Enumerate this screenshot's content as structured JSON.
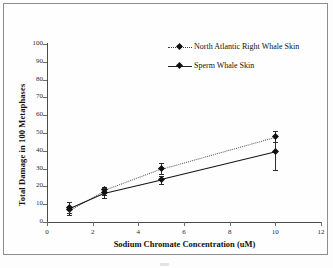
{
  "chart_data": {
    "type": "line",
    "title": "",
    "xlabel": "Sodium Chromate Concentration (uM)",
    "ylabel": "Total Damage in 100 Metaphases",
    "x": [
      1,
      2.5,
      5,
      10
    ],
    "xlim": [
      0,
      12
    ],
    "ylim": [
      0,
      100
    ],
    "xticks": [
      0,
      2,
      4,
      6,
      8,
      10,
      12
    ],
    "yticks": [
      0,
      10,
      20,
      30,
      40,
      50,
      60,
      70,
      80,
      90,
      100
    ],
    "xtick_labels": [
      "0",
      "2",
      "4",
      "6",
      "8",
      "10",
      "12"
    ],
    "ytick_labels": [
      "0",
      "10",
      "20",
      "30",
      "40",
      "50",
      "60",
      "70",
      "80",
      "90",
      "100"
    ],
    "grid": false,
    "legend_position": "upper right inside",
    "series": [
      {
        "name": "North Atlantic Right Whale Skin",
        "style": "dotted",
        "marker": "diamond",
        "color": "#333333",
        "values": [
          7,
          18,
          30,
          48
        ],
        "err_low": [
          4,
          15,
          27,
          45
        ],
        "err_high": [
          11,
          19.5,
          33,
          51
        ]
      },
      {
        "name": "Sperm Whale Skin",
        "style": "solid",
        "marker": "diamond",
        "color": "#141414",
        "values": [
          8,
          16.5,
          24,
          39.5
        ],
        "err_low": [
          5,
          13.5,
          21.5,
          29
        ],
        "err_high": [
          11,
          19,
          26,
          45
        ]
      }
    ]
  },
  "legend": {
    "items": [
      {
        "label": "North Atlantic Right Whale Skin",
        "style": "dotted"
      },
      {
        "label": "Sperm Whale Skin",
        "style": "solid"
      }
    ]
  },
  "axes": {
    "x_title": "Sodium Chromate Concentration (uM)",
    "y_title": "Total Damage in 100 Metaphases"
  }
}
